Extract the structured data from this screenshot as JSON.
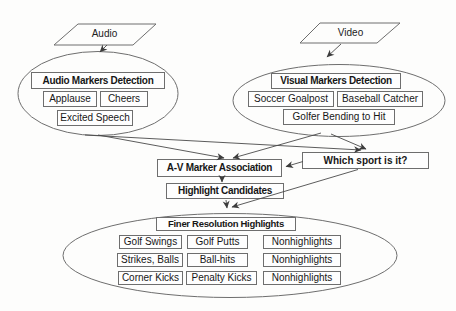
{
  "diagram": {
    "colors": {
      "background": "#fdfdfc",
      "line": "#4a4a4a",
      "shape_stroke": "#6e6e6e",
      "text": "#171717"
    },
    "inputs": {
      "audio": "Audio",
      "video": "Video"
    },
    "audio_group": {
      "title": "Audio Markers Detection",
      "items": [
        "Applause",
        "Cheers",
        "Excited Speech"
      ]
    },
    "video_group": {
      "title": "Visual Markers Detection",
      "items": [
        "Soccer Goalpost",
        "Baseball Catcher",
        "Golfer Bending to Hit"
      ]
    },
    "middle": {
      "association": "A-V Marker Association",
      "sport_question": "Which sport is it?",
      "candidates": "Highlight Candidates"
    },
    "finer_group": {
      "title": "Finer Resolution Highlights",
      "rows": [
        [
          "Golf Swings",
          "Golf Putts",
          "Nonhighlights"
        ],
        [
          "Strikes, Balls",
          "Ball-hits",
          "Nonhighlights"
        ],
        [
          "Corner Kicks",
          "Penalty Kicks",
          "Nonhighlights"
        ]
      ]
    }
  }
}
